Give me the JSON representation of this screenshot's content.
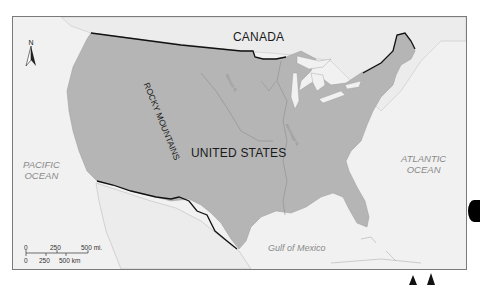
{
  "map": {
    "north_arrow_label": "N",
    "countries": {
      "canada": "CANADA",
      "usa": "UNITED STATES",
      "mexico": "MEXICO"
    },
    "mountains": "ROCKY MOUNTAINS",
    "oceans": {
      "pacific_line1": "PACIFIC",
      "pacific_line2": "OCEAN",
      "atlantic_line1": "ATLANTIC",
      "atlantic_line2": "OCEAN",
      "gulf": "Gulf of Mexico"
    },
    "rivers": {
      "missouri": "Missouri R.",
      "mississippi": "Mississippi R."
    },
    "scale": {
      "miles": [
        "0",
        "250",
        "500 mi."
      ],
      "km": [
        "0",
        "250",
        "500 km"
      ]
    },
    "colors": {
      "land_us": "#b5b5b5",
      "land_other": "#ececec",
      "water": "#f3f3f3",
      "border": "#111111"
    }
  }
}
